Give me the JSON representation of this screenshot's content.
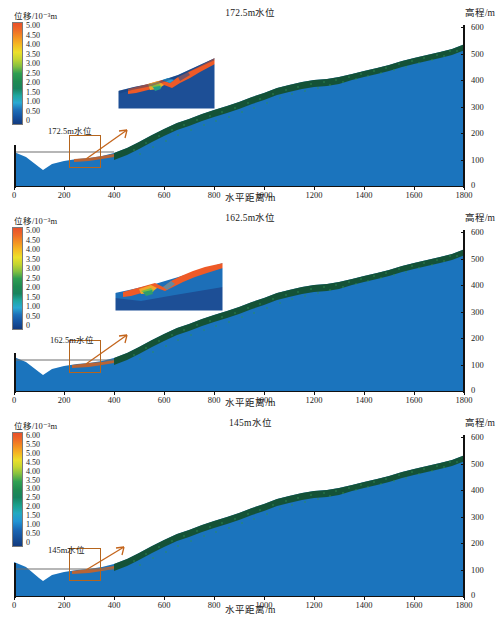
{
  "figure": {
    "axis": {
      "xlabel": "水平距离/m",
      "ylabel": "高程/m",
      "xticks": [
        "0",
        "200",
        "400",
        "600",
        "800",
        "1000",
        "1200",
        "1400",
        "1600",
        "1800"
      ],
      "yticks": [
        "600",
        "500",
        "400",
        "300",
        "200",
        "100",
        "0"
      ],
      "xlim": [
        0,
        1800
      ],
      "ylim": [
        0,
        600
      ]
    },
    "legend_title": "位移/10⁻³m",
    "colors": {
      "water_body": "#1b74bd",
      "slope_fill": "#1b74bd",
      "surface_layer": "#1b5e3a",
      "roi_box": "#b5651d",
      "arrow": "#c4651c",
      "waterline": "#6e6e6e",
      "axis": "#111111",
      "inset_hot": "#ee5a27",
      "inset_cool": "#1d4f96",
      "inset_mid": "#2fa05a"
    }
  },
  "panels": [
    {
      "id": "panel-1725",
      "title": "172.5m水位",
      "water_level_label": "172.5m水位",
      "water_level_value": 172.5,
      "legend_ticks": [
        "5.00",
        "4.50",
        "4.00",
        "3.50",
        "3.00",
        "2.50",
        "2.00",
        "1.50",
        "1.00",
        "0.50",
        "0"
      ],
      "legend_max": 5.0,
      "legend_min": 0
    },
    {
      "id": "panel-1625",
      "title": "162.5m水位",
      "water_level_label": "162.5m水位",
      "water_level_value": 162.5,
      "legend_ticks": [
        "5.00",
        "4.50",
        "4.00",
        "3.50",
        "3.00",
        "2.50",
        "2.00",
        "1.50",
        "1.00",
        "0.50",
        "0"
      ],
      "legend_max": 5.0,
      "legend_min": 0
    },
    {
      "id": "panel-145",
      "title": "145m水位",
      "water_level_label": "145m水位",
      "water_level_value": 145,
      "legend_ticks": [
        "6.00",
        "5.50",
        "5.00",
        "4.50",
        "4.00",
        "3.50",
        "3.00",
        "2.50",
        "2.00",
        "1.50",
        "1.00",
        "0.50",
        "0"
      ],
      "legend_max": 6.0,
      "legend_min": 0
    }
  ],
  "chart_data": {
    "type": "area",
    "xlabel": "水平距离/m",
    "ylabel": "高程/m",
    "xlim": [
      0,
      1800
    ],
    "ylim": [
      0,
      600
    ],
    "grid": false,
    "legend_position": "top-left",
    "units": {
      "displacement": "10^-3 m",
      "distance": "m",
      "elevation": "m"
    },
    "x": [
      0,
      50,
      100,
      115,
      150,
      200,
      250,
      300,
      350,
      400,
      450,
      500,
      550,
      600,
      650,
      700,
      750,
      800,
      850,
      900,
      950,
      1000,
      1050,
      1100,
      1150,
      1200,
      1250,
      1300,
      1350,
      1400,
      1450,
      1500,
      1550,
      1600,
      1650,
      1700,
      1750,
      1800
    ],
    "series": [
      {
        "name": "地表高程 (ground surface elevation)",
        "values": [
          128,
          110,
          72,
          62,
          82,
          95,
          100,
          104,
          112,
          125,
          143,
          168,
          192,
          214,
          236,
          252,
          268,
          284,
          300,
          316,
          334,
          352,
          368,
          382,
          392,
          398,
          404,
          412,
          422,
          434,
          446,
          458,
          470,
          482,
          494,
          506,
          516,
          524
        ]
      }
    ],
    "panels": [
      {
        "name": "172.5m水位",
        "water_level": 172.5,
        "colorbar": {
          "min": 0,
          "max": 5.0,
          "step": 0.5,
          "ticks": [
            5.0,
            4.5,
            4.0,
            3.5,
            3.0,
            2.5,
            2.0,
            1.5,
            1.0,
            0.5,
            0
          ]
        }
      },
      {
        "name": "162.5m水位",
        "water_level": 162.5,
        "colorbar": {
          "min": 0,
          "max": 5.0,
          "step": 0.5,
          "ticks": [
            5.0,
            4.5,
            4.0,
            3.5,
            3.0,
            2.5,
            2.0,
            1.5,
            1.0,
            0.5,
            0
          ]
        }
      },
      {
        "name": "145m水位",
        "water_level": 145,
        "colorbar": {
          "min": 0,
          "max": 6.0,
          "step": 0.5,
          "ticks": [
            6.0,
            5.5,
            5.0,
            4.5,
            4.0,
            3.5,
            3.0,
            2.5,
            2.0,
            1.5,
            1.0,
            0.5,
            0
          ]
        }
      }
    ]
  }
}
